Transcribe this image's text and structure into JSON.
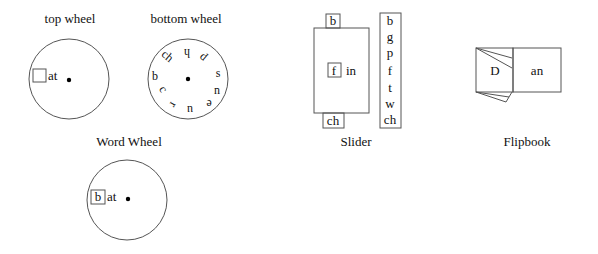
{
  "word_wheel": {
    "title": "Word Wheel",
    "top_wheel": {
      "label": "top wheel",
      "slot": "",
      "suffix": "at"
    },
    "bottom_wheel": {
      "label": "bottom wheel",
      "letters": [
        "h",
        "p",
        "s",
        "n",
        "e",
        "u",
        "r",
        "c",
        "b",
        "ch"
      ]
    },
    "combined": {
      "slot": "b",
      "suffix": "at"
    }
  },
  "slider": {
    "title": "Slider",
    "top_tab": "b",
    "bottom_tab": "ch",
    "window": "f",
    "suffix": "in",
    "strip": [
      "b",
      "g",
      "p",
      "f",
      "t",
      "w",
      "ch"
    ]
  },
  "flipbook": {
    "title": "Flipbook",
    "left_page": "D",
    "right_page": "an"
  },
  "colors": {
    "stroke": "#555555",
    "text": "#111111",
    "background": "#ffffff"
  }
}
